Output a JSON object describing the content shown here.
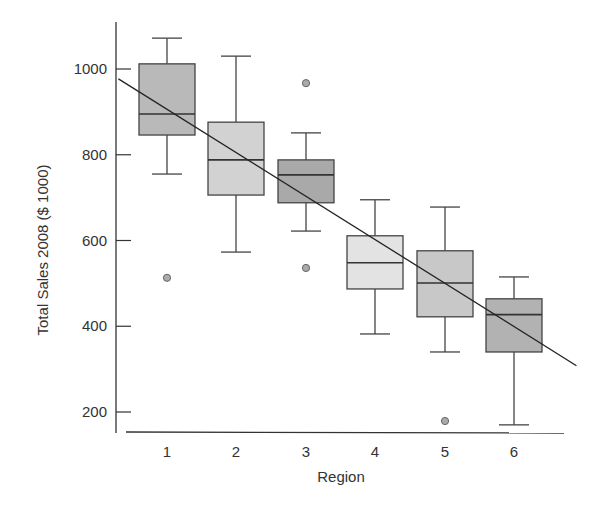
{
  "chart_data": {
    "type": "boxplot",
    "title": "",
    "xlabel": "Region",
    "ylabel": "Total Sales 2008 ($ 1000)",
    "categories": [
      "1",
      "2",
      "3",
      "4",
      "5",
      "6"
    ],
    "y_ticks": [
      200,
      400,
      600,
      800,
      1000
    ],
    "ylim": [
      155,
      1115
    ],
    "grid": false,
    "legend": null,
    "series": [
      {
        "name": "1",
        "whisker_low": 755,
        "q1": 846,
        "median": 895,
        "q3": 1012,
        "whisker_high": 1072,
        "outliers": [
          513
        ],
        "fill": "#b9b9b9"
      },
      {
        "name": "2",
        "whisker_low": 573,
        "q1": 706,
        "median": 788,
        "q3": 876,
        "whisker_high": 1030,
        "outliers": [],
        "fill": "#d2d2d2"
      },
      {
        "name": "3",
        "whisker_low": 622,
        "q1": 688,
        "median": 753,
        "q3": 788,
        "whisker_high": 851,
        "outliers": [
          967,
          536
        ],
        "fill": "#a9a9a9"
      },
      {
        "name": "4",
        "whisker_low": 382,
        "q1": 487,
        "median": 548,
        "q3": 611,
        "whisker_high": 695,
        "outliers": [],
        "fill": "#e3e3e3"
      },
      {
        "name": "5",
        "whisker_low": 340,
        "q1": 422,
        "median": 501,
        "q3": 576,
        "whisker_high": 678,
        "outliers": [
          179
        ],
        "fill": "#c8c8c8"
      },
      {
        "name": "6",
        "whisker_low": 170,
        "q1": 340,
        "median": 427,
        "q3": 464,
        "whisker_high": 515,
        "outliers": [],
        "fill": "#b2b2b2"
      }
    ],
    "annotations": [
      {
        "type": "regression_line",
        "description": "Downward trend line across regions",
        "from": {
          "x": 0.3,
          "y": 977
        },
        "to": {
          "x": 6.9,
          "y": 308
        }
      }
    ]
  },
  "colors": {
    "axis": "#333333",
    "box_stroke": "#444444",
    "outlier_fill": "#aaaaaa"
  }
}
